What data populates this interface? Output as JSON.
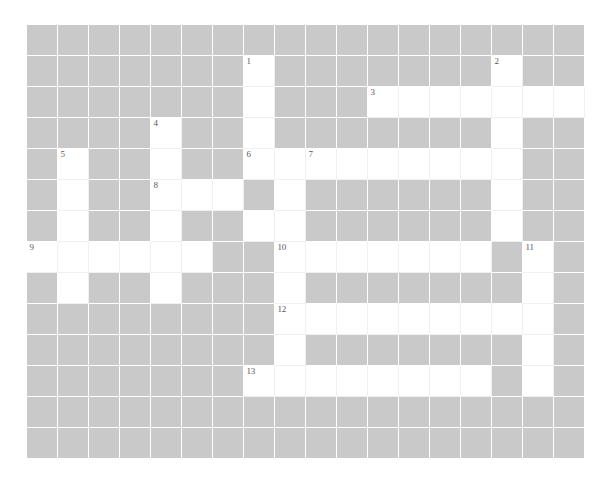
{
  "puzzle": {
    "title": "Crossword Grid",
    "type": "crossword-grid",
    "columns": 18,
    "rows": 14,
    "cell_size": 31,
    "origin_x": 27,
    "origin_y": 25,
    "colors": {
      "block": "#c9c9c9",
      "open": "#ffffff",
      "gridline": "#ffffff",
      "page_background": "#ffffff",
      "number_text": "#5a5a5a"
    },
    "grid": [
      "##################",
      "#######1########2#",
      "#######.###O###...",
      "####4##.#######.##",
      "#5##.##6.7.....O##",
      "#O##8..#.######O##",
      "#O##O##..######O##",
      "9.....##10.....#11#",
      "#O##O###O######O##",
      "########12......O#",
      "########O#######O#",
      "#######13.......#O",
      "##################",
      "##################"
    ],
    "legend": {
      "#": "blocked cell (gray)",
      ".": "open cell (white)",
      "O": "open cell (white)",
      "digits": "open cell with clue number"
    },
    "numbered_cells": [
      {
        "number": "1",
        "row": 1,
        "col": 7
      },
      {
        "number": "2",
        "row": 1,
        "col": 15
      },
      {
        "number": "3",
        "row": 2,
        "col": 11
      },
      {
        "number": "4",
        "row": 3,
        "col": 4
      },
      {
        "number": "5",
        "row": 4,
        "col": 1
      },
      {
        "number": "6",
        "row": 4,
        "col": 7
      },
      {
        "number": "7",
        "row": 4,
        "col": 9
      },
      {
        "number": "8",
        "row": 5,
        "col": 4
      },
      {
        "number": "9",
        "row": 7,
        "col": 0
      },
      {
        "number": "10",
        "row": 7,
        "col": 8
      },
      {
        "number": "11",
        "row": 7,
        "col": 16
      },
      {
        "number": "12",
        "row": 9,
        "col": 8
      },
      {
        "number": "13",
        "row": 11,
        "col": 7
      }
    ],
    "open_cells": [
      {
        "row": 1,
        "col": 7
      },
      {
        "row": 1,
        "col": 15
      },
      {
        "row": 2,
        "col": 7
      },
      {
        "row": 2,
        "col": 11
      },
      {
        "row": 2,
        "col": 12
      },
      {
        "row": 2,
        "col": 13
      },
      {
        "row": 2,
        "col": 14
      },
      {
        "row": 2,
        "col": 15
      },
      {
        "row": 2,
        "col": 16
      },
      {
        "row": 2,
        "col": 17
      },
      {
        "row": 3,
        "col": 4
      },
      {
        "row": 3,
        "col": 7
      },
      {
        "row": 3,
        "col": 15
      },
      {
        "row": 4,
        "col": 1
      },
      {
        "row": 4,
        "col": 4
      },
      {
        "row": 4,
        "col": 7
      },
      {
        "row": 4,
        "col": 8
      },
      {
        "row": 4,
        "col": 9
      },
      {
        "row": 4,
        "col": 10
      },
      {
        "row": 4,
        "col": 11
      },
      {
        "row": 4,
        "col": 12
      },
      {
        "row": 4,
        "col": 13
      },
      {
        "row": 4,
        "col": 14
      },
      {
        "row": 4,
        "col": 15
      },
      {
        "row": 5,
        "col": 1
      },
      {
        "row": 5,
        "col": 4
      },
      {
        "row": 5,
        "col": 5
      },
      {
        "row": 5,
        "col": 6
      },
      {
        "row": 5,
        "col": 8
      },
      {
        "row": 5,
        "col": 15
      },
      {
        "row": 6,
        "col": 1
      },
      {
        "row": 6,
        "col": 4
      },
      {
        "row": 6,
        "col": 7
      },
      {
        "row": 6,
        "col": 8
      },
      {
        "row": 6,
        "col": 15
      },
      {
        "row": 7,
        "col": 0
      },
      {
        "row": 7,
        "col": 1
      },
      {
        "row": 7,
        "col": 2
      },
      {
        "row": 7,
        "col": 3
      },
      {
        "row": 7,
        "col": 4
      },
      {
        "row": 7,
        "col": 5
      },
      {
        "row": 7,
        "col": 8
      },
      {
        "row": 7,
        "col": 9
      },
      {
        "row": 7,
        "col": 10
      },
      {
        "row": 7,
        "col": 11
      },
      {
        "row": 7,
        "col": 12
      },
      {
        "row": 7,
        "col": 13
      },
      {
        "row": 7,
        "col": 14
      },
      {
        "row": 7,
        "col": 16
      },
      {
        "row": 8,
        "col": 1
      },
      {
        "row": 8,
        "col": 4
      },
      {
        "row": 8,
        "col": 8
      },
      {
        "row": 8,
        "col": 16
      },
      {
        "row": 9,
        "col": 8
      },
      {
        "row": 9,
        "col": 9
      },
      {
        "row": 9,
        "col": 10
      },
      {
        "row": 9,
        "col": 11
      },
      {
        "row": 9,
        "col": 12
      },
      {
        "row": 9,
        "col": 13
      },
      {
        "row": 9,
        "col": 14
      },
      {
        "row": 9,
        "col": 15
      },
      {
        "row": 9,
        "col": 16
      },
      {
        "row": 10,
        "col": 8
      },
      {
        "row": 10,
        "col": 16
      },
      {
        "row": 11,
        "col": 7
      },
      {
        "row": 11,
        "col": 8
      },
      {
        "row": 11,
        "col": 9
      },
      {
        "row": 11,
        "col": 10
      },
      {
        "row": 11,
        "col": 11
      },
      {
        "row": 11,
        "col": 12
      },
      {
        "row": 11,
        "col": 13
      },
      {
        "row": 11,
        "col": 14
      },
      {
        "row": 11,
        "col": 16
      }
    ]
  }
}
